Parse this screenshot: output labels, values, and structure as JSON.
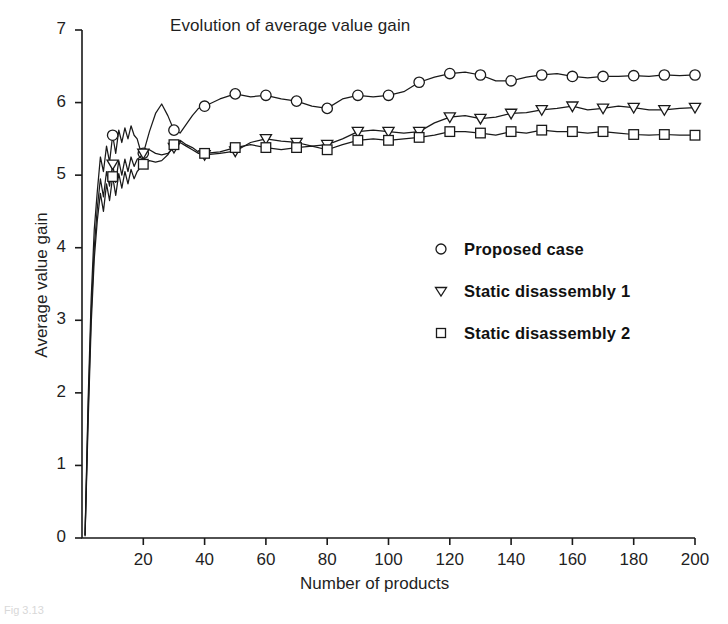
{
  "figure": {
    "background": "#ffffff",
    "ink_color": "#1a1a1a",
    "caption_fragment": "Fig 3.13"
  },
  "chart_data": {
    "type": "line",
    "title": "Evolution of average value gain",
    "xlabel": "Number of products",
    "ylabel": "Average value gain",
    "xlim": [
      0,
      200
    ],
    "ylim": [
      0,
      7
    ],
    "xticks": [
      20,
      40,
      60,
      80,
      100,
      120,
      140,
      160,
      180,
      200
    ],
    "yticks": [
      0,
      1,
      2,
      3,
      4,
      5,
      6,
      7
    ],
    "grid": false,
    "legend_position": "center-right",
    "marker_interval": 10,
    "series": [
      {
        "name": "Proposed case",
        "marker": "circle",
        "x": [
          1,
          2,
          3,
          4,
          5,
          6,
          7,
          8,
          9,
          10,
          11,
          12,
          13,
          14,
          15,
          16,
          17,
          18,
          19,
          20,
          22,
          24,
          26,
          28,
          30,
          32,
          34,
          36,
          38,
          40,
          45,
          50,
          55,
          60,
          65,
          70,
          75,
          80,
          85,
          90,
          95,
          100,
          105,
          110,
          115,
          120,
          125,
          130,
          135,
          140,
          145,
          150,
          155,
          160,
          165,
          170,
          175,
          180,
          185,
          190,
          195,
          200
        ],
        "values": [
          0.05,
          1.9,
          3.3,
          4.25,
          4.78,
          5.25,
          5.05,
          5.4,
          5.18,
          5.55,
          5.3,
          5.62,
          5.45,
          5.65,
          5.5,
          5.68,
          5.55,
          5.5,
          5.35,
          5.3,
          5.6,
          5.85,
          5.98,
          5.82,
          5.62,
          5.58,
          5.7,
          5.82,
          5.92,
          5.95,
          6.05,
          6.12,
          6.08,
          6.1,
          6.05,
          6.02,
          5.95,
          5.92,
          6.05,
          6.1,
          6.08,
          6.1,
          6.15,
          6.28,
          6.35,
          6.4,
          6.42,
          6.38,
          6.3,
          6.3,
          6.35,
          6.38,
          6.4,
          6.36,
          6.34,
          6.36,
          6.36,
          6.37,
          6.36,
          6.38,
          6.37,
          6.38
        ]
      },
      {
        "name": "Static disassembly 1",
        "marker": "triangle-down",
        "x": [
          1,
          2,
          3,
          4,
          5,
          6,
          7,
          8,
          9,
          10,
          11,
          12,
          13,
          14,
          15,
          16,
          17,
          18,
          19,
          20,
          22,
          24,
          26,
          28,
          30,
          32,
          34,
          36,
          38,
          40,
          45,
          50,
          55,
          60,
          65,
          70,
          75,
          80,
          85,
          90,
          95,
          100,
          105,
          110,
          115,
          120,
          125,
          130,
          135,
          140,
          145,
          150,
          155,
          160,
          165,
          170,
          175,
          180,
          185,
          190,
          195,
          200
        ],
        "values": [
          0.04,
          1.75,
          3.1,
          4.0,
          4.55,
          4.95,
          4.7,
          5.05,
          4.85,
          5.15,
          4.9,
          5.2,
          5.0,
          5.22,
          5.05,
          5.25,
          5.12,
          5.22,
          5.25,
          5.3,
          5.35,
          5.3,
          5.28,
          5.3,
          5.38,
          5.45,
          5.4,
          5.35,
          5.3,
          5.28,
          5.3,
          5.33,
          5.45,
          5.5,
          5.47,
          5.45,
          5.4,
          5.42,
          5.5,
          5.6,
          5.62,
          5.6,
          5.58,
          5.6,
          5.72,
          5.8,
          5.82,
          5.78,
          5.8,
          5.85,
          5.86,
          5.9,
          5.92,
          5.95,
          5.9,
          5.92,
          5.95,
          5.93,
          5.9,
          5.9,
          5.92,
          5.93
        ]
      },
      {
        "name": "Static disassembly 2",
        "marker": "square",
        "x": [
          1,
          2,
          3,
          4,
          5,
          6,
          7,
          8,
          9,
          10,
          11,
          12,
          13,
          14,
          15,
          16,
          17,
          18,
          19,
          20,
          22,
          24,
          26,
          28,
          30,
          32,
          34,
          36,
          38,
          40,
          45,
          50,
          55,
          60,
          65,
          70,
          75,
          80,
          85,
          90,
          95,
          100,
          105,
          110,
          115,
          120,
          125,
          130,
          135,
          140,
          145,
          150,
          155,
          160,
          165,
          170,
          175,
          180,
          185,
          190,
          195,
          200
        ],
        "values": [
          0.03,
          1.6,
          2.95,
          3.85,
          4.38,
          4.75,
          4.5,
          4.88,
          4.65,
          4.98,
          4.72,
          5.02,
          4.82,
          5.05,
          4.88,
          5.08,
          4.95,
          5.05,
          5.1,
          5.15,
          5.2,
          5.18,
          5.2,
          5.28,
          5.42,
          5.48,
          5.42,
          5.38,
          5.32,
          5.3,
          5.32,
          5.38,
          5.42,
          5.38,
          5.35,
          5.38,
          5.4,
          5.35,
          5.42,
          5.48,
          5.5,
          5.48,
          5.5,
          5.52,
          5.55,
          5.6,
          5.6,
          5.58,
          5.55,
          5.6,
          5.58,
          5.62,
          5.6,
          5.6,
          5.58,
          5.6,
          5.58,
          5.56,
          5.55,
          5.56,
          5.55,
          5.55
        ]
      }
    ]
  },
  "legend": {
    "items": [
      {
        "label": "Proposed case",
        "marker": "circle"
      },
      {
        "label": "Static disassembly 1",
        "marker": "triangle-down"
      },
      {
        "label": "Static disassembly 2",
        "marker": "square"
      }
    ]
  }
}
